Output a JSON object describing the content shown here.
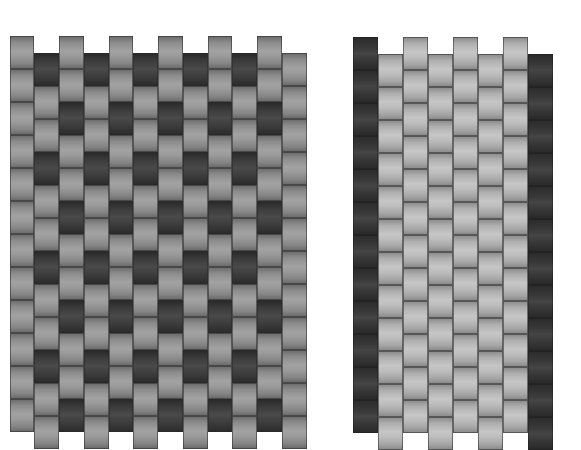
{
  "figure": {
    "colors": {
      "background": "#ffffff",
      "mid_gray": "#959595",
      "dark_gray": "#3a3a3a",
      "light_gray": "#b8b8b8"
    },
    "brick": {
      "width": 24.75,
      "height": 33,
      "stagger": 16.5
    },
    "left_panel": {
      "x": 9.5,
      "columns": 12,
      "col_width": 24.75,
      "even_top": 36,
      "odd_top": 52.5,
      "bricks_per_column": 12,
      "edge_columns_shade": "mid",
      "interior_base_shade": "mid",
      "dark_period": 3,
      "odd_dark_offset": 0,
      "even_dark_offset": 2
    },
    "right_panel": {
      "x": 353,
      "columns": 8,
      "col_width": 25,
      "even_top": 37,
      "odd_top": 53.5,
      "bricks_per_column": 12,
      "edge_columns_shade": "darkcol",
      "interior_base_shade": "light"
    }
  }
}
